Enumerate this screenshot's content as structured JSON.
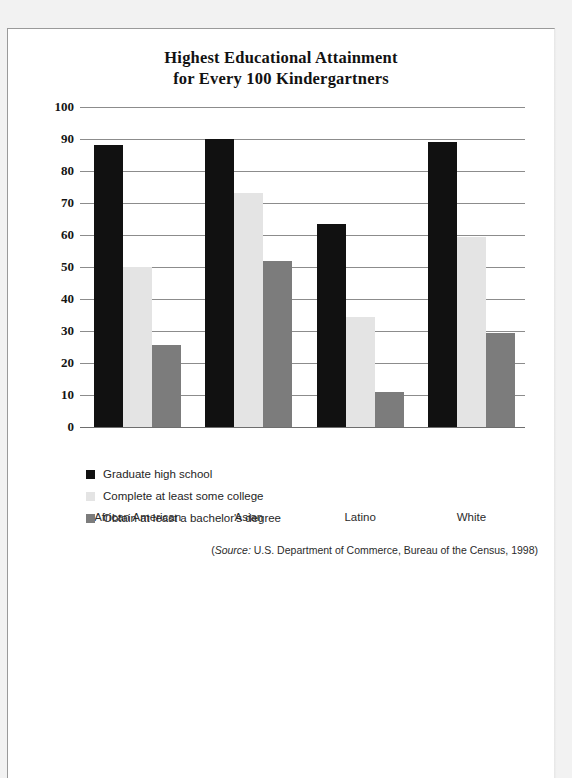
{
  "chart_data": {
    "type": "bar",
    "title": "Highest Educational Attainment for Every 100 Kindergartners",
    "title_lines": [
      "Highest Educational Attainment",
      "for Every 100 Kindergartners"
    ],
    "xlabel": "",
    "ylabel": "",
    "ylim": [
      0,
      100
    ],
    "yticks": [
      0,
      10,
      20,
      30,
      40,
      50,
      60,
      70,
      80,
      90,
      100
    ],
    "grid": true,
    "legend_position": "below-left",
    "categories": [
      "African American",
      "Asian",
      "Latino",
      "White"
    ],
    "series": [
      {
        "name": "Graduate high school",
        "color": "#111111",
        "values": [
          88,
          90,
          63.5,
          89
        ]
      },
      {
        "name": "Complete at least some college",
        "color": "#e4e4e4",
        "values": [
          50,
          73,
          34.5,
          59.5
        ]
      },
      {
        "name": "Obtain at least a bachelor's degree",
        "color": "#7c7c7c",
        "values": [
          25.5,
          52,
          11,
          29.5
        ]
      }
    ],
    "source_prefix": "(",
    "source_word": "Source:",
    "source_text": " U.S. Department of Commerce, Bureau of the Census, 1998)",
    "source_full": "(Source: U.S. Department of Commerce, Bureau of the Census, 1998)"
  }
}
